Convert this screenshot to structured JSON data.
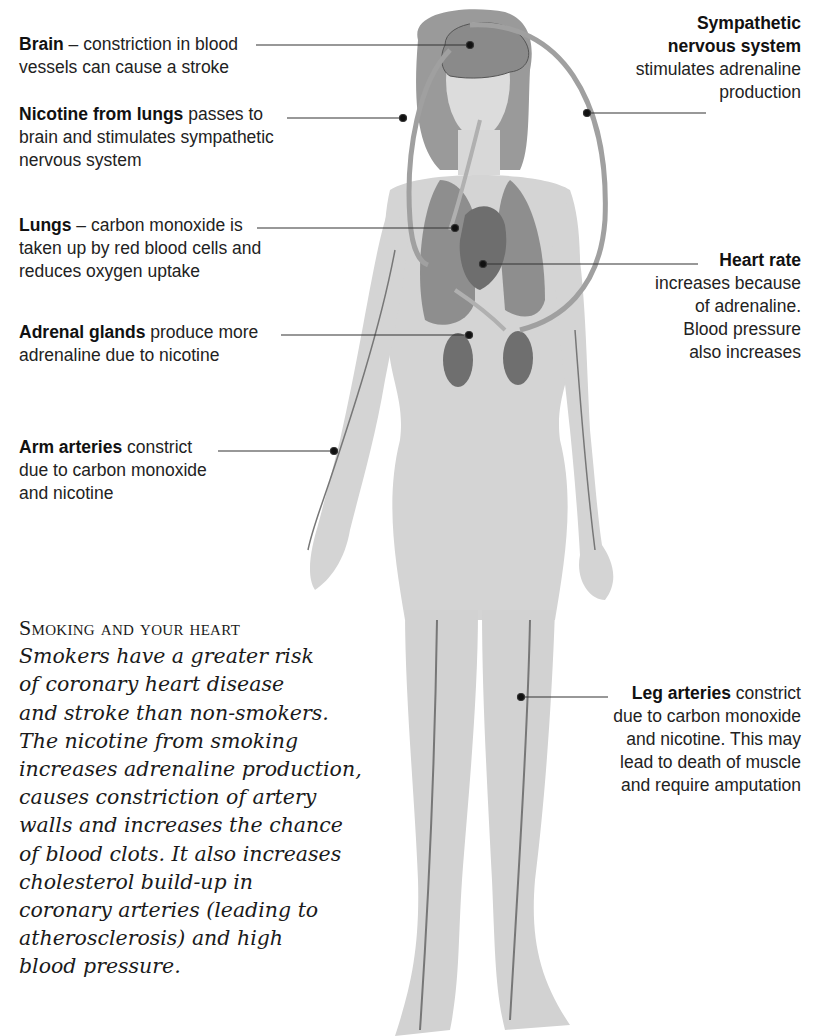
{
  "labels": {
    "brain": {
      "bold": "Brain",
      "rest": " – constriction in blood",
      "line2": "vessels can cause a stroke"
    },
    "nicotine": {
      "bold": "Nicotine from lungs",
      "rest": " passes to",
      "line2": "brain and stimulates sympathetic",
      "line3": "nervous system"
    },
    "lungs": {
      "bold": "Lungs",
      "rest": " – carbon monoxide is",
      "line2": "taken up by red blood cells and",
      "line3": "reduces oxygen uptake"
    },
    "adrenal": {
      "bold": "Adrenal glands",
      "rest": " produce more",
      "line2": "adrenaline due to nicotine"
    },
    "arm": {
      "bold": "Arm arteries",
      "rest": " constrict",
      "line2": "due to carbon monoxide",
      "line3": "and nicotine"
    },
    "sympathetic": {
      "bold1": "Sympathetic",
      "bold2": "nervous system",
      "line3": "stimulates adrenaline",
      "line4": "production"
    },
    "heart": {
      "bold": "Heart rate",
      "line2": "increases because",
      "line3": "of adrenaline.",
      "line4": "Blood pressure",
      "line5": "also increases"
    },
    "leg": {
      "bold": "Leg arteries",
      "rest": " constrict",
      "line2": "due to carbon monoxide",
      "line3": "and nicotine. This may",
      "line4": "lead to death of muscle",
      "line5": "and require amputation"
    }
  },
  "essay": {
    "title": "Smoking and your heart",
    "lines": [
      "Smokers have a greater risk",
      "of coronary heart disease",
      "and stroke than non-smokers.",
      "The nicotine from smoking",
      "increases adrenaline production,",
      "causes constriction of artery",
      "walls and increases the chance",
      "of blood clots. It also increases",
      "cholesterol build-up in",
      "coronary arteries (leading to",
      "atherosclerosis) and high",
      "blood pressure."
    ]
  },
  "colors": {
    "body": "#d6d6d6",
    "hair": "#8f8f8f",
    "organ": "#7d7d7d",
    "leader": "#333333"
  }
}
